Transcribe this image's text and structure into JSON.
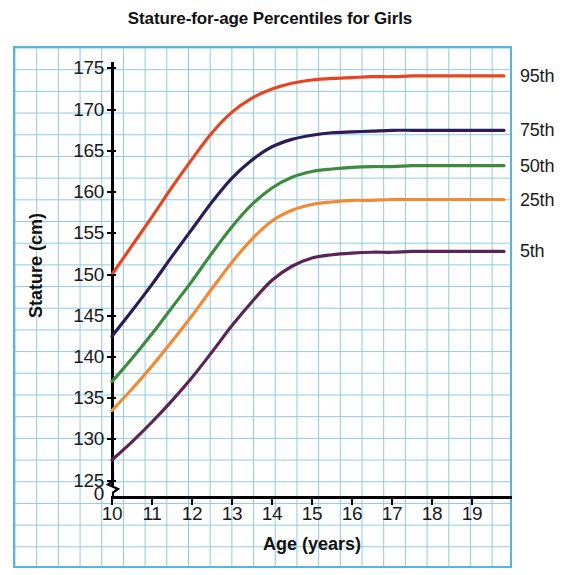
{
  "chart_data": {
    "type": "line",
    "title": "Stature-for-age Percentiles for Girls",
    "xlabel": "Age (years)",
    "ylabel": "Stature (cm)",
    "xlim": [
      10,
      20
    ],
    "ylim": [
      123,
      177
    ],
    "grid": true,
    "legend_position": "right-of-curves",
    "axis_break_y": "0",
    "xticks": [
      "10",
      "11",
      "12",
      "13",
      "14",
      "15",
      "16",
      "17",
      "18",
      "19"
    ],
    "xtick_values": [
      10,
      11,
      12,
      13,
      14,
      15,
      16,
      17,
      18,
      19
    ],
    "yticks": [
      "125",
      "130",
      "135",
      "140",
      "145",
      "150",
      "155",
      "160",
      "165",
      "170",
      "175"
    ],
    "ytick_values": [
      125,
      130,
      135,
      140,
      145,
      150,
      155,
      160,
      165,
      170,
      175
    ],
    "zero_tick": "0",
    "x": [
      10,
      10.5,
      11,
      11.5,
      12,
      12.5,
      13,
      13.5,
      14,
      14.5,
      15,
      15.5,
      16,
      16.5,
      17,
      17.5,
      18,
      18.5,
      19,
      19.8
    ],
    "series": [
      {
        "name": "95th",
        "label": "95th",
        "color": "#e6451f",
        "values": [
          150.0,
          153.5,
          157.0,
          160.6,
          164.0,
          167.2,
          169.7,
          171.4,
          172.5,
          173.2,
          173.6,
          173.8,
          173.9,
          174.0,
          174.0,
          174.1,
          174.1,
          174.1,
          174.1,
          174.1
        ]
      },
      {
        "name": "75th",
        "label": "75th",
        "color": "#2b1b57",
        "values": [
          142.5,
          145.6,
          148.8,
          152.2,
          155.5,
          158.8,
          161.7,
          163.9,
          165.5,
          166.4,
          166.9,
          167.2,
          167.3,
          167.4,
          167.5,
          167.5,
          167.5,
          167.5,
          167.5,
          167.5
        ]
      },
      {
        "name": "50th",
        "label": "50th",
        "color": "#3d8b3d",
        "values": [
          137.0,
          139.8,
          142.8,
          146.0,
          149.2,
          152.6,
          155.8,
          158.5,
          160.5,
          161.8,
          162.5,
          162.8,
          163.0,
          163.1,
          163.1,
          163.2,
          163.2,
          163.2,
          163.2,
          163.2
        ]
      },
      {
        "name": "25th",
        "label": "25th",
        "color": "#f08a35",
        "values": [
          133.5,
          136.1,
          138.9,
          141.9,
          145.0,
          148.3,
          151.5,
          154.3,
          156.5,
          157.8,
          158.5,
          158.8,
          159.0,
          159.0,
          159.1,
          159.1,
          159.1,
          159.1,
          159.1,
          159.1
        ]
      },
      {
        "name": "5th",
        "label": "5th",
        "color": "#5c2355",
        "values": [
          127.5,
          129.7,
          132.1,
          134.7,
          137.5,
          140.6,
          143.8,
          146.7,
          149.3,
          151.0,
          152.0,
          152.4,
          152.6,
          152.7,
          152.7,
          152.8,
          152.8,
          152.8,
          152.8,
          152.8
        ]
      }
    ]
  }
}
